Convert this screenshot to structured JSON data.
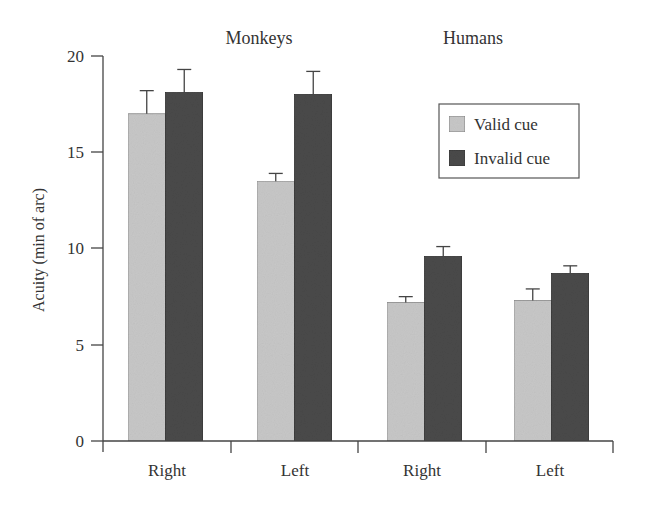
{
  "chart_data": {
    "type": "bar",
    "title": "",
    "xlabel": "",
    "ylabel": "Acuity (min of arc)",
    "ylim": [
      0,
      20
    ],
    "yticks": [
      0,
      5,
      10,
      15,
      20
    ],
    "grid": false,
    "legend_position": "upper right (inside)",
    "group_labels": [
      "Monkeys",
      "Humans"
    ],
    "categories": [
      "Right",
      "Left",
      "Right",
      "Left"
    ],
    "category_groups": [
      "Monkeys",
      "Monkeys",
      "Humans",
      "Humans"
    ],
    "series": [
      {
        "name": "Valid cue",
        "color": "#c8c8c8",
        "values": [
          17.0,
          13.5,
          7.2,
          7.3
        ],
        "error_upper": [
          18.2,
          13.9,
          7.5,
          7.9
        ]
      },
      {
        "name": "Invalid cue",
        "color": "#4a4a4a",
        "values": [
          18.1,
          18.0,
          9.6,
          8.7
        ],
        "error_upper": [
          19.3,
          19.2,
          10.1,
          9.1
        ]
      }
    ]
  },
  "labels": {
    "ylabel": "Acuity (min of arc)",
    "group_monkeys": "Monkeys",
    "group_humans": "Humans",
    "legend_valid": "Valid cue",
    "legend_invalid": "Invalid cue",
    "cat_0": "Right",
    "cat_1": "Left",
    "cat_2": "Right",
    "cat_3": "Left",
    "ytick_0": "0",
    "ytick_5": "5",
    "ytick_10": "10",
    "ytick_15": "15",
    "ytick_20": "20"
  }
}
